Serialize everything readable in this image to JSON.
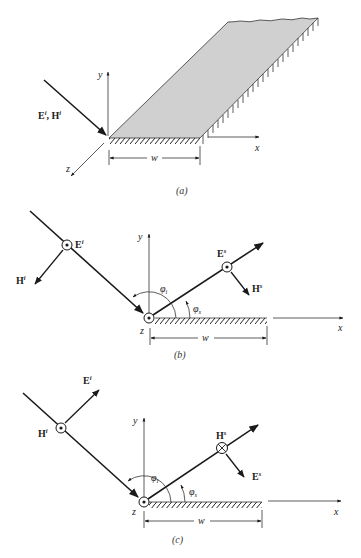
{
  "figure": {
    "panels": [
      {
        "id": "a",
        "caption": "(a)",
        "labels": {
          "incident": "E",
          "incident_sup": "i",
          "incident_sep": ", ",
          "incident2": "H",
          "incident2_sup": "i",
          "y_axis": "y",
          "x_axis": "x",
          "z_axis": "z",
          "width": "w"
        },
        "plate_color": "#d0d0d0"
      },
      {
        "id": "b",
        "caption": "(b)",
        "labels": {
          "E_inc": "E",
          "E_inc_sup": "i",
          "H_inc": "H",
          "H_inc_sup": "i",
          "E_scat": "E",
          "E_scat_sup": "s",
          "H_scat": "H",
          "H_scat_sup": "s",
          "phi_i": "φ",
          "phi_i_sub": "i",
          "phi_s": "φ",
          "phi_s_sub": "s",
          "y_axis": "y",
          "x_axis": "x",
          "z_axis": "z",
          "width": "w"
        },
        "polarization": "TM (E along z, out of page)"
      },
      {
        "id": "c",
        "caption": "(c)",
        "labels": {
          "E_inc": "E",
          "E_inc_sup": "i",
          "H_inc": "H",
          "H_inc_sup": "i",
          "E_scat": "E",
          "E_scat_sup": "s",
          "H_scat": "H",
          "H_scat_sup": "s",
          "phi_i": "φ",
          "phi_i_sub": "i",
          "phi_s": "φ",
          "phi_s_sub": "s",
          "y_axis": "y",
          "x_axis": "x",
          "z_axis": "z",
          "width": "w"
        },
        "polarization": "TE (H along z)"
      }
    ],
    "colors": {
      "line": "#1a1a1a",
      "plate_fill": "#d0d0d0",
      "axis": "#333333"
    }
  }
}
